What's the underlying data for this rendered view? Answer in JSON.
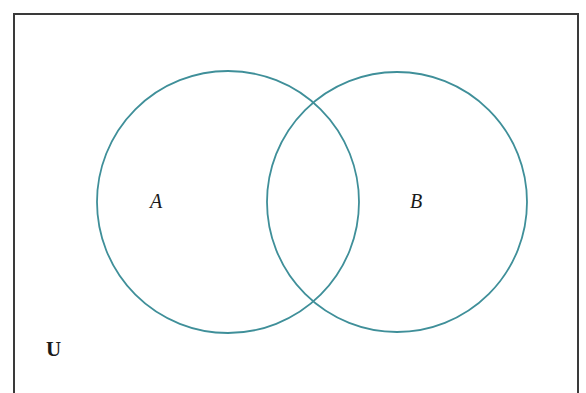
{
  "diagram": {
    "type": "venn",
    "universe_label": "U",
    "sets": [
      {
        "label": "A",
        "cx": 228,
        "cy": 202,
        "r": 131
      },
      {
        "label": "B",
        "cx": 397,
        "cy": 202,
        "r": 130
      }
    ],
    "frame": {
      "x": 13,
      "y": 13,
      "width": 565,
      "height": 380
    },
    "colors": {
      "circle": "#3f8f99",
      "frame": "#3a3a3a",
      "text": "#1a1a1a"
    }
  }
}
